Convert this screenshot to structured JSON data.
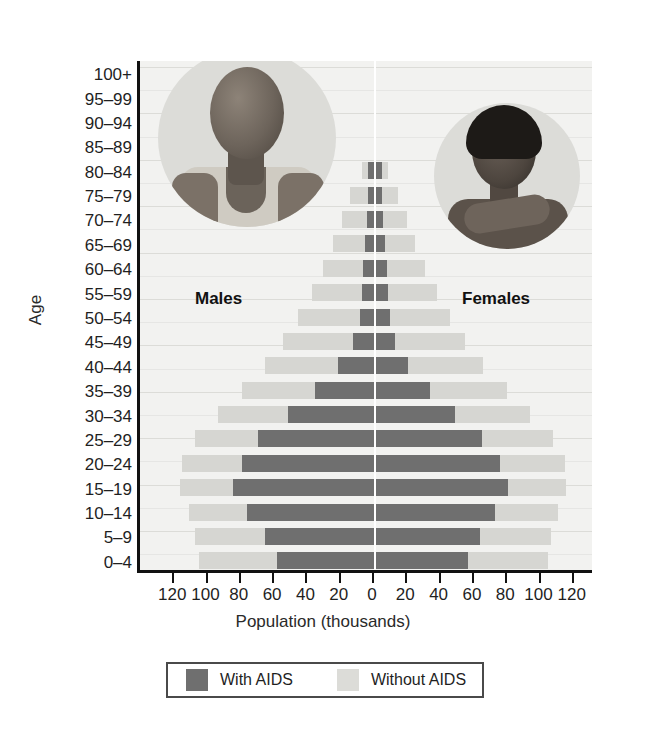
{
  "chart_data": {
    "type": "bar",
    "subtype": "population-pyramid",
    "title": "",
    "xlabel": "Population (thousands)",
    "ylabel": "Age",
    "xlim": [
      -120,
      120
    ],
    "x_tick_values": [
      -120,
      -100,
      -80,
      -60,
      -40,
      -20,
      0,
      20,
      40,
      60,
      80,
      100,
      120
    ],
    "x_tick_labels": [
      "120",
      "100",
      "80",
      "60",
      "40",
      "20",
      "0",
      "20",
      "40",
      "60",
      "80",
      "100",
      "120"
    ],
    "grid": false,
    "legend_position": "bottom",
    "side_labels": {
      "left": "Males",
      "right": "Females"
    },
    "categories": [
      "0–4",
      "5–9",
      "10–14",
      "15–19",
      "20–24",
      "25–29",
      "30–34",
      "35–39",
      "40–44",
      "45–49",
      "50–54",
      "55–59",
      "60–64",
      "65–69",
      "70–74",
      "75–79",
      "80–84",
      "85–89",
      "90–94",
      "95–99",
      "100+"
    ],
    "series": [
      {
        "name": "With AIDS",
        "color": "#6f6f6f",
        "males": [
          59,
          66,
          77,
          85,
          80,
          70,
          52,
          36,
          22,
          13,
          9,
          8,
          7,
          6,
          5,
          4,
          4,
          0,
          0,
          0,
          0
        ],
        "females": [
          56,
          63,
          72,
          80,
          75,
          64,
          48,
          33,
          20,
          12,
          9,
          8,
          7,
          6,
          5,
          4,
          4,
          0,
          0,
          0,
          0
        ]
      },
      {
        "name": "Without AIDS",
        "color": "#d6d6d2",
        "males": [
          106,
          108,
          112,
          117,
          116,
          108,
          94,
          80,
          66,
          55,
          46,
          38,
          31,
          25,
          20,
          15,
          8,
          0,
          0,
          0,
          0
        ],
        "females": [
          104,
          106,
          110,
          115,
          114,
          107,
          93,
          79,
          65,
          54,
          45,
          37,
          30,
          24,
          19,
          14,
          8,
          0,
          0,
          0,
          0
        ]
      }
    ]
  },
  "legend": {
    "items": [
      {
        "label": "With AIDS",
        "swatch": "dark"
      },
      {
        "label": "Without AIDS",
        "swatch": "light"
      }
    ]
  },
  "photos": [
    {
      "name": "male-patient-photo",
      "alt": "Photograph of an emaciated man in a vest"
    },
    {
      "name": "female-patient-photo",
      "alt": "Photograph of a woman resting her head on her hand"
    }
  ]
}
